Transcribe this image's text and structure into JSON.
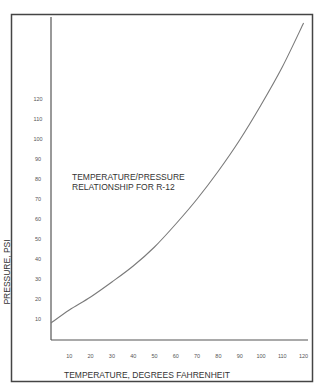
{
  "chart_data": {
    "type": "line",
    "title": [
      "TEMPERATURE/PRESSURE",
      "RELATIONSHIP FOR R-12"
    ],
    "xlabel": "TEMPERATURE, DEGREES FAHRENHEIT",
    "ylabel": "PRESSURE, PSI",
    "xlim": [
      0,
      120
    ],
    "ylim": [
      0,
      160
    ],
    "grid": false,
    "legend": "none",
    "x_ticks": [
      10,
      20,
      30,
      40,
      50,
      60,
      70,
      80,
      90,
      100,
      110,
      120
    ],
    "y_ticks": [
      10,
      20,
      30,
      40,
      50,
      60,
      70,
      80,
      90,
      100,
      110,
      120
    ],
    "x_tick_labels": [
      "10",
      "20",
      "30",
      "40",
      "50",
      "60",
      "70",
      "80",
      "90",
      "100",
      "110",
      "120"
    ],
    "y_tick_labels": [
      "10",
      "20",
      "30",
      "40",
      "50",
      "60",
      "70",
      "80",
      "90",
      "100",
      "110",
      "120"
    ],
    "series": [
      {
        "name": "R-12",
        "x": [
          0,
          10,
          20,
          30,
          40,
          50,
          60,
          70,
          80,
          90,
          100,
          110,
          120
        ],
        "values": [
          8,
          14.5,
          21,
          28.5,
          36.5,
          46,
          57.5,
          70,
          84,
          99.5,
          117,
          136,
          158
        ]
      }
    ]
  },
  "colors": {
    "line": "#7a7a7a",
    "axis": "#555555",
    "frame": "#444444",
    "text": "#333333"
  }
}
